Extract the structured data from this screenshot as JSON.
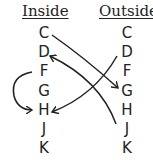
{
  "headers": {
    "inside": "Inside",
    "outside": "Outside"
  },
  "inside": [
    "C",
    "D",
    "F",
    "G",
    "H",
    "J",
    "K"
  ],
  "outside": [
    "C",
    "D",
    "F",
    "G",
    "H",
    "J",
    "K"
  ],
  "arrows": [
    {
      "from": "inside.C",
      "to": "outside.G"
    },
    {
      "from": "outside.J",
      "to": "inside.D"
    },
    {
      "from": "outside.D",
      "to": "inside.H"
    },
    {
      "from": "inside.F",
      "to": "inside.H",
      "style": "curved-left"
    }
  ],
  "colors": {
    "ink": "#222222",
    "background": "#ffffff"
  }
}
